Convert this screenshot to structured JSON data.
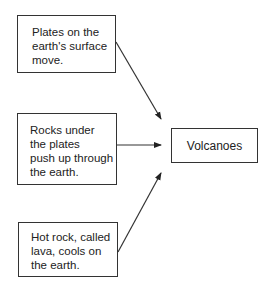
{
  "diagram": {
    "type": "cause-effect flow",
    "causes": [
      {
        "id": "b1",
        "text": "Plates on the\nearth's surface\nmove."
      },
      {
        "id": "b2",
        "text": "Rocks under\nthe plates\npush up through\nthe earth."
      },
      {
        "id": "b3",
        "text": "Hot rock, called\nlava, cools on\nthe earth."
      }
    ],
    "effect": {
      "id": "target",
      "text": "Volcanoes"
    },
    "edges": [
      {
        "from": "b1",
        "to": "target"
      },
      {
        "from": "b2",
        "to": "target"
      },
      {
        "from": "b3",
        "to": "target"
      }
    ]
  }
}
